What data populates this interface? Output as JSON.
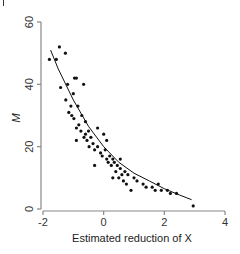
{
  "chart_data": {
    "type": "scatter",
    "title": "",
    "xlabel": "Estimated reduction of X",
    "ylabel": "M",
    "xlim": [
      -2,
      4
    ],
    "ylim": [
      0,
      60
    ],
    "x_ticks": [
      -2,
      0,
      2,
      4
    ],
    "y_ticks": [
      0,
      20,
      40,
      60
    ],
    "x_tick_labels": [
      "-2",
      "0",
      "2",
      "4"
    ],
    "y_tick_labels": [
      "0",
      "20",
      "40",
      "60"
    ],
    "grid": false,
    "legend": null,
    "series": [
      {
        "name": "observations",
        "marker": "filled-circle",
        "color": "#111111",
        "points": [
          [
            -1.46,
            52
          ],
          [
            -1.26,
            50
          ],
          [
            -1.79,
            48
          ],
          [
            -1.56,
            48
          ],
          [
            -1.42,
            39
          ],
          [
            -1.19,
            40
          ],
          [
            -0.96,
            42
          ],
          [
            -0.9,
            42
          ],
          [
            -0.66,
            40
          ],
          [
            -1.25,
            35
          ],
          [
            -1.08,
            33
          ],
          [
            -1.15,
            31
          ],
          [
            -1.05,
            30
          ],
          [
            -0.85,
            33
          ],
          [
            -0.98,
            29
          ],
          [
            -0.82,
            27
          ],
          [
            -0.72,
            30
          ],
          [
            -0.6,
            28
          ],
          [
            -0.9,
            26
          ],
          [
            -0.75,
            25
          ],
          [
            -0.6,
            24
          ],
          [
            -0.5,
            25
          ],
          [
            -0.65,
            23
          ],
          [
            -0.55,
            22
          ],
          [
            -0.42,
            23
          ],
          [
            -0.35,
            21
          ],
          [
            -0.48,
            20
          ],
          [
            -0.3,
            19
          ],
          [
            -0.2,
            20
          ],
          [
            -0.1,
            18
          ],
          [
            0.05,
            19
          ],
          [
            -0.05,
            17
          ],
          [
            0.1,
            16
          ],
          [
            0.2,
            17
          ],
          [
            0.3,
            16
          ],
          [
            0.15,
            15
          ],
          [
            0.25,
            14
          ],
          [
            0.35,
            15
          ],
          [
            0.45,
            14
          ],
          [
            0.4,
            12
          ],
          [
            0.55,
            13
          ],
          [
            0.6,
            11
          ],
          [
            0.7,
            12
          ],
          [
            0.5,
            10
          ],
          [
            0.65,
            9
          ],
          [
            0.8,
            11
          ],
          [
            0.75,
            8
          ],
          [
            0.55,
            16
          ],
          [
            -0.9,
            22
          ],
          [
            -0.3,
            14
          ],
          [
            0.1,
            22
          ],
          [
            0.3,
            10
          ],
          [
            1.0,
            10
          ],
          [
            1.1,
            9
          ],
          [
            0.9,
            6
          ],
          [
            1.3,
            8
          ],
          [
            1.4,
            7
          ],
          [
            1.6,
            7
          ],
          [
            1.7,
            6
          ],
          [
            1.8,
            8
          ],
          [
            1.9,
            6
          ],
          [
            2.1,
            6
          ],
          [
            2.2,
            5
          ],
          [
            2.4,
            5
          ],
          [
            2.95,
            1
          ],
          [
            -0.2,
            26
          ],
          [
            0.0,
            24
          ],
          [
            -1.0,
            37
          ]
        ]
      }
    ],
    "fit_curve": {
      "name": "fitted curve",
      "color": "#111111",
      "points": [
        [
          -1.75,
          51
        ],
        [
          -1.5,
          45
        ],
        [
          -1.0,
          35
        ],
        [
          -0.5,
          26.5
        ],
        [
          0.0,
          20
        ],
        [
          0.5,
          15
        ],
        [
          1.0,
          11.5
        ],
        [
          1.5,
          9
        ],
        [
          2.0,
          6.5
        ],
        [
          2.5,
          4.5
        ],
        [
          2.9,
          3
        ]
      ]
    }
  }
}
